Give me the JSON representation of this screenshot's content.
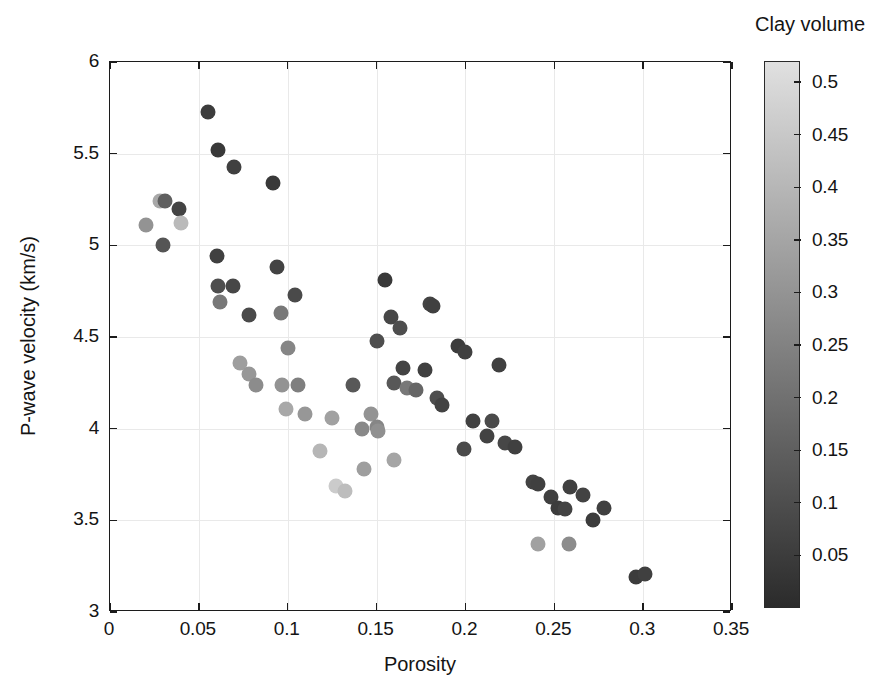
{
  "chart_data": {
    "type": "scatter",
    "title": "",
    "xlabel": "Porosity",
    "ylabel": "P-wave velocity (km/s)",
    "xlim": [
      0,
      0.35
    ],
    "ylim": [
      3,
      6
    ],
    "xticks": [
      "0",
      "0.05",
      "0.1",
      "0.15",
      "0.2",
      "0.25",
      "0.3",
      "0.35"
    ],
    "xtick_values": [
      0,
      0.05,
      0.1,
      0.15,
      0.2,
      0.25,
      0.3,
      0.35
    ],
    "yticks": [
      "3",
      "3.5",
      "4",
      "4.5",
      "5",
      "5.5",
      "6"
    ],
    "ytick_values": [
      3,
      3.5,
      4,
      4.5,
      5,
      5.5,
      6
    ],
    "grid": true,
    "colorbar": {
      "label": "Clay volume",
      "ticks": [
        "0.05",
        "0.1",
        "0.15",
        "0.2",
        "0.25",
        "0.3",
        "0.35",
        "0.4",
        "0.45",
        "0.5"
      ],
      "tick_values": [
        0.05,
        0.1,
        0.15,
        0.2,
        0.25,
        0.3,
        0.35,
        0.4,
        0.45,
        0.5
      ],
      "vmin": 0.0,
      "vmax": 0.52,
      "colormap": "grayscale",
      "low_color": "#2b2b2b",
      "high_color": "#e0e0e0",
      "position": "right"
    },
    "marker": "circle",
    "marker_size_px": 15,
    "series": [
      {
        "name": "Core samples",
        "color_by": "clay_volume",
        "points": [
          {
            "x": 0.02,
            "y": 5.11,
            "c": 0.3
          },
          {
            "x": 0.028,
            "y": 5.24,
            "c": 0.36
          },
          {
            "x": 0.031,
            "y": 5.24,
            "c": 0.15
          },
          {
            "x": 0.03,
            "y": 5.0,
            "c": 0.12
          },
          {
            "x": 0.039,
            "y": 5.2,
            "c": 0.07
          },
          {
            "x": 0.04,
            "y": 5.12,
            "c": 0.41
          },
          {
            "x": 0.055,
            "y": 5.73,
            "c": 0.05
          },
          {
            "x": 0.061,
            "y": 5.52,
            "c": 0.04
          },
          {
            "x": 0.06,
            "y": 4.94,
            "c": 0.06
          },
          {
            "x": 0.061,
            "y": 4.78,
            "c": 0.1
          },
          {
            "x": 0.062,
            "y": 4.69,
            "c": 0.22
          },
          {
            "x": 0.069,
            "y": 4.78,
            "c": 0.08
          },
          {
            "x": 0.07,
            "y": 5.43,
            "c": 0.06
          },
          {
            "x": 0.073,
            "y": 4.36,
            "c": 0.33
          },
          {
            "x": 0.078,
            "y": 4.3,
            "c": 0.31
          },
          {
            "x": 0.078,
            "y": 4.62,
            "c": 0.09
          },
          {
            "x": 0.082,
            "y": 4.24,
            "c": 0.28
          },
          {
            "x": 0.092,
            "y": 5.34,
            "c": 0.04
          },
          {
            "x": 0.094,
            "y": 4.88,
            "c": 0.07
          },
          {
            "x": 0.096,
            "y": 4.63,
            "c": 0.22
          },
          {
            "x": 0.097,
            "y": 4.24,
            "c": 0.3
          },
          {
            "x": 0.099,
            "y": 4.11,
            "c": 0.36
          },
          {
            "x": 0.1,
            "y": 4.44,
            "c": 0.26
          },
          {
            "x": 0.104,
            "y": 4.73,
            "c": 0.09
          },
          {
            "x": 0.106,
            "y": 4.24,
            "c": 0.24
          },
          {
            "x": 0.11,
            "y": 4.08,
            "c": 0.31
          },
          {
            "x": 0.118,
            "y": 3.88,
            "c": 0.4
          },
          {
            "x": 0.125,
            "y": 4.06,
            "c": 0.34
          },
          {
            "x": 0.127,
            "y": 3.69,
            "c": 0.46
          },
          {
            "x": 0.132,
            "y": 3.66,
            "c": 0.42
          },
          {
            "x": 0.137,
            "y": 4.24,
            "c": 0.13
          },
          {
            "x": 0.142,
            "y": 4.0,
            "c": 0.27
          },
          {
            "x": 0.143,
            "y": 3.78,
            "c": 0.33
          },
          {
            "x": 0.147,
            "y": 4.08,
            "c": 0.3
          },
          {
            "x": 0.15,
            "y": 4.01,
            "c": 0.26
          },
          {
            "x": 0.15,
            "y": 4.48,
            "c": 0.1
          },
          {
            "x": 0.151,
            "y": 3.99,
            "c": 0.29
          },
          {
            "x": 0.155,
            "y": 4.81,
            "c": 0.04
          },
          {
            "x": 0.158,
            "y": 4.61,
            "c": 0.08
          },
          {
            "x": 0.16,
            "y": 4.25,
            "c": 0.13
          },
          {
            "x": 0.16,
            "y": 3.83,
            "c": 0.35
          },
          {
            "x": 0.163,
            "y": 4.55,
            "c": 0.1
          },
          {
            "x": 0.165,
            "y": 4.33,
            "c": 0.07
          },
          {
            "x": 0.167,
            "y": 4.22,
            "c": 0.22
          },
          {
            "x": 0.172,
            "y": 4.21,
            "c": 0.17
          },
          {
            "x": 0.177,
            "y": 4.32,
            "c": 0.06
          },
          {
            "x": 0.18,
            "y": 4.68,
            "c": 0.07
          },
          {
            "x": 0.182,
            "y": 4.67,
            "c": 0.06
          },
          {
            "x": 0.184,
            "y": 4.17,
            "c": 0.1
          },
          {
            "x": 0.187,
            "y": 4.13,
            "c": 0.07
          },
          {
            "x": 0.196,
            "y": 4.45,
            "c": 0.05
          },
          {
            "x": 0.2,
            "y": 4.42,
            "c": 0.06
          },
          {
            "x": 0.199,
            "y": 3.89,
            "c": 0.09
          },
          {
            "x": 0.204,
            "y": 4.04,
            "c": 0.06
          },
          {
            "x": 0.212,
            "y": 3.96,
            "c": 0.07
          },
          {
            "x": 0.215,
            "y": 4.04,
            "c": 0.09
          },
          {
            "x": 0.219,
            "y": 4.35,
            "c": 0.06
          },
          {
            "x": 0.222,
            "y": 3.92,
            "c": 0.08
          },
          {
            "x": 0.228,
            "y": 3.9,
            "c": 0.06
          },
          {
            "x": 0.238,
            "y": 3.71,
            "c": 0.07
          },
          {
            "x": 0.241,
            "y": 3.7,
            "c": 0.06
          },
          {
            "x": 0.241,
            "y": 3.37,
            "c": 0.34
          },
          {
            "x": 0.248,
            "y": 3.63,
            "c": 0.06
          },
          {
            "x": 0.252,
            "y": 3.57,
            "c": 0.05
          },
          {
            "x": 0.256,
            "y": 3.56,
            "c": 0.07
          },
          {
            "x": 0.258,
            "y": 3.37,
            "c": 0.28
          },
          {
            "x": 0.259,
            "y": 3.68,
            "c": 0.06
          },
          {
            "x": 0.266,
            "y": 3.64,
            "c": 0.07
          },
          {
            "x": 0.272,
            "y": 3.5,
            "c": 0.05
          },
          {
            "x": 0.278,
            "y": 3.57,
            "c": 0.06
          },
          {
            "x": 0.296,
            "y": 3.19,
            "c": 0.05
          },
          {
            "x": 0.301,
            "y": 3.21,
            "c": 0.06
          }
        ]
      }
    ]
  }
}
